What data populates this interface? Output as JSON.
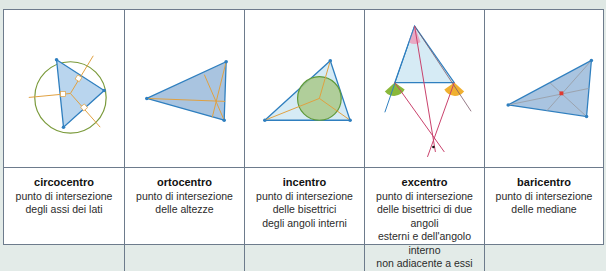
{
  "colors": {
    "border": "#6d7b8c",
    "triangle_fill": "#b5cfe6",
    "triangle_stroke": "#2f7fbf",
    "orange_line": "#e0a040",
    "green_circle": "#6b9a3a",
    "red_line": "#c8406a"
  },
  "figures": [
    {
      "name": "circocentro",
      "icon": "circumcenter-diagram"
    },
    {
      "name": "ortocentro",
      "icon": "orthocenter-diagram"
    },
    {
      "name": "incentro",
      "icon": "incenter-diagram"
    },
    {
      "name": "excentro",
      "icon": "excenter-diagram"
    },
    {
      "name": "baricentro",
      "icon": "centroid-diagram"
    }
  ],
  "captions": [
    {
      "title": "circocentro",
      "lines": [
        "punto di intersezione",
        "degli assi dei lati"
      ]
    },
    {
      "title": "ortocentro",
      "lines": [
        "punto di intersezione",
        "delle altezze"
      ]
    },
    {
      "title": "incentro",
      "lines": [
        "punto di intersezione",
        "delle bisettrici",
        "degli angoli interni"
      ]
    },
    {
      "title": "excentro",
      "lines": [
        "punto di intersezione",
        "delle bisettrici di due angoli",
        "esterni e dell'angolo interno",
        "non adiacente a essi"
      ]
    },
    {
      "title": "baricentro",
      "lines": [
        "punto di intersezione",
        "delle mediane"
      ]
    }
  ]
}
